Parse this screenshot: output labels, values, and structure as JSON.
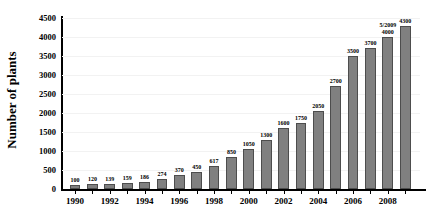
{
  "chart_data": {
    "type": "bar",
    "title": "",
    "xlabel": "",
    "ylabel": "Number of plants",
    "ylim": [
      0,
      4500
    ],
    "ytick_step": 500,
    "ytick_labels": [
      "0",
      "500",
      "1000",
      "1500",
      "2000",
      "2500",
      "3000",
      "3500",
      "4000",
      "4500"
    ],
    "grid": true,
    "legend": "none",
    "categories": [
      "1990",
      "1991",
      "1992",
      "1993",
      "1994",
      "1995",
      "1996",
      "1997",
      "1998",
      "1999",
      "2000",
      "2001",
      "2002",
      "2003",
      "2004",
      "2005",
      "2006",
      "2007",
      "2008",
      "2009"
    ],
    "xtick_labels": [
      "1990",
      "1992",
      "1994",
      "1996",
      "1998",
      "2000",
      "2002",
      "2004",
      "2006",
      "2008"
    ],
    "values": [
      100,
      120,
      139,
      159,
      186,
      274,
      370,
      450,
      617,
      850,
      1050,
      1300,
      1600,
      1750,
      2050,
      2700,
      3500,
      3700,
      4000,
      4300
    ],
    "data_labels": [
      "100",
      "120",
      "139",
      "159",
      "186",
      "274",
      "370",
      "450",
      "617",
      "850",
      "1050",
      "1300",
      "1600",
      "1750",
      "2050",
      "2700",
      "3500",
      "3700",
      "4000",
      "4300"
    ],
    "annotations": [
      {
        "text": "5/2009",
        "at_index": 18
      }
    ],
    "bar_color": "#808080",
    "bar_edge_color": "#4d4d4d",
    "grid_color": "#f2f2f2",
    "axis_color": "#000000",
    "background_color": "#ffffff"
  }
}
